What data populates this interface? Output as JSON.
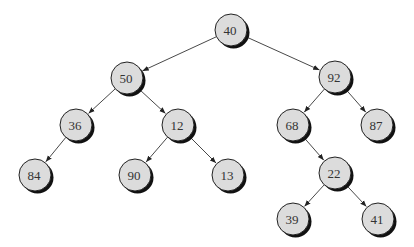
{
  "diagram": {
    "type": "binary-tree",
    "colors": {
      "node_fill": "#dcdcdc",
      "node_stroke": "#222222",
      "shadow": "#111111",
      "edge": "#333333",
      "label": "#333333"
    },
    "node_radius": 16,
    "nodes": [
      {
        "id": "n40",
        "label": "40",
        "x": 231,
        "y": 30
      },
      {
        "id": "n50",
        "label": "50",
        "x": 127,
        "y": 78
      },
      {
        "id": "n92",
        "label": "92",
        "x": 335,
        "y": 77
      },
      {
        "id": "n36",
        "label": "36",
        "x": 76,
        "y": 125
      },
      {
        "id": "n12",
        "label": "12",
        "x": 178,
        "y": 125
      },
      {
        "id": "n68",
        "label": "68",
        "x": 293,
        "y": 125
      },
      {
        "id": "n87",
        "label": "87",
        "x": 377,
        "y": 125
      },
      {
        "id": "n84",
        "label": "84",
        "x": 35,
        "y": 175
      },
      {
        "id": "n90",
        "label": "90",
        "x": 135,
        "y": 175
      },
      {
        "id": "n13",
        "label": "13",
        "x": 228,
        "y": 175
      },
      {
        "id": "n22",
        "label": "22",
        "x": 335,
        "y": 173
      },
      {
        "id": "n39",
        "label": "39",
        "x": 293,
        "y": 219
      },
      {
        "id": "n41",
        "label": "41",
        "x": 378,
        "y": 219
      }
    ],
    "edges": [
      {
        "from": "n40",
        "to": "n50"
      },
      {
        "from": "n40",
        "to": "n92"
      },
      {
        "from": "n50",
        "to": "n36"
      },
      {
        "from": "n50",
        "to": "n12"
      },
      {
        "from": "n92",
        "to": "n68"
      },
      {
        "from": "n92",
        "to": "n87"
      },
      {
        "from": "n36",
        "to": "n84"
      },
      {
        "from": "n12",
        "to": "n90"
      },
      {
        "from": "n12",
        "to": "n13"
      },
      {
        "from": "n68",
        "to": "n22"
      },
      {
        "from": "n22",
        "to": "n39"
      },
      {
        "from": "n22",
        "to": "n41"
      }
    ]
  }
}
